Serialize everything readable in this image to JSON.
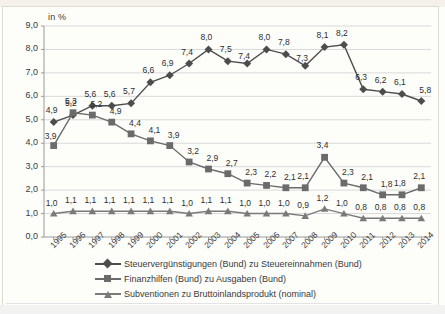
{
  "chart_data": {
    "type": "line",
    "title": "",
    "ylabel": "in %",
    "xlabel": "",
    "ylim": [
      0,
      9
    ],
    "ytick_labels": [
      "0,0",
      "1,0",
      "2,0",
      "3,0",
      "4,0",
      "5,0",
      "6,0",
      "7,0",
      "8,0",
      "9,0"
    ],
    "ytick_values": [
      0,
      1,
      2,
      3,
      4,
      5,
      6,
      7,
      8,
      9
    ],
    "grid": true,
    "legend_position": "bottom",
    "categories": [
      "1995",
      "1996",
      "1997",
      "1998",
      "1999",
      "2000",
      "2001",
      "2002",
      "2003",
      "2004",
      "2005",
      "2006",
      "2007",
      "2008",
      "2009",
      "2010",
      "2011",
      "2012",
      "2013",
      "2014"
    ],
    "series": [
      {
        "name": "Steuervergünstigungen (Bund) zu Steuereinnahmen (Bund)",
        "marker": "diamond",
        "color": "#4d4d4d",
        "values": [
          4.9,
          5.2,
          5.6,
          5.6,
          5.7,
          6.6,
          6.9,
          7.4,
          8.0,
          7.5,
          7.4,
          8.0,
          7.8,
          7.3,
          8.1,
          8.2,
          6.3,
          6.2,
          6.1,
          5.8
        ],
        "labels": [
          "4,9",
          "5,2",
          "5,6",
          "5,6",
          "5,7",
          "6,6",
          "6,9",
          "7,4",
          "8,0",
          "7,5",
          "7,4",
          "8,0",
          "7,8",
          "7,3",
          "8,1",
          "8,2",
          "6,3",
          "6,2",
          "6,1",
          "5,8"
        ]
      },
      {
        "name": "Finanzhilfen (Bund) zu Ausgaben (Bund)",
        "marker": "square",
        "color": "#6b6b6b",
        "values": [
          3.9,
          5.3,
          5.2,
          4.9,
          4.4,
          4.1,
          3.9,
          3.2,
          2.9,
          2.7,
          2.3,
          2.2,
          2.1,
          2.1,
          3.4,
          2.3,
          2.1,
          1.8,
          1.8,
          2.1
        ],
        "labels": [
          "3,9",
          "5,3",
          "5,2",
          "4,9",
          "4,4",
          "4,1",
          "3,9",
          "3,2",
          "2,9",
          "2,7",
          "2,3",
          "2,2",
          "2,1",
          "2,1",
          "3,4",
          "2,3",
          "2,1",
          "1,8",
          "1,8",
          "2,1"
        ]
      },
      {
        "name": "Subventionen zu Bruttoinlandsprodukt (nominal)",
        "marker": "triangle",
        "color": "#7a7a7a",
        "values": [
          1.0,
          1.1,
          1.1,
          1.1,
          1.1,
          1.1,
          1.1,
          1.0,
          1.1,
          1.1,
          1.0,
          1.0,
          1.0,
          0.9,
          1.2,
          1.0,
          0.8,
          0.8,
          0.8,
          0.8
        ],
        "labels": [
          "1,0",
          "1,1",
          "1,1",
          "1,1",
          "1,1",
          "1,1",
          "1,1",
          "1,0",
          "1,1",
          "1,1",
          "1,0",
          "1,0",
          "1,0",
          "0,9",
          "1,2",
          "1,0",
          "0,8",
          "0,8",
          "0,8",
          "0,8"
        ]
      }
    ]
  },
  "colors": {
    "grid": "#d9d9d9",
    "axis": "#9a9a9a",
    "text": "#3a3a3a",
    "background": "#fdfdfa"
  }
}
